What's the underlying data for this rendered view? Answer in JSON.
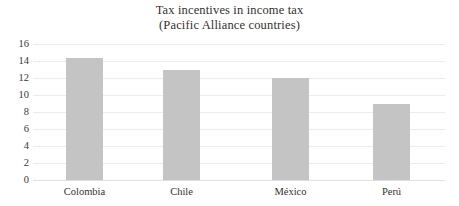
{
  "chart_data": {
    "type": "bar",
    "title": "Tax incentives in income tax",
    "subtitle": "(Pacific Alliance countries)",
    "xlabel": "",
    "ylabel": "",
    "categories": [
      "Colombia",
      "Chile",
      "México",
      "Perú"
    ],
    "values": [
      14.3,
      13.0,
      12.0,
      9.0
    ],
    "series": [
      {
        "name": "Tax incentives in income tax",
        "values": [
          14.3,
          13.0,
          12.0,
          9.0
        ]
      }
    ],
    "ylim": [
      0,
      16
    ],
    "ytick_labels": [
      "16",
      "14",
      "12",
      "10",
      "8",
      "6",
      "4",
      "2",
      "0"
    ],
    "ytick_values": [
      16,
      14,
      12,
      10,
      8,
      6,
      4,
      2,
      0
    ],
    "grid": true,
    "grid_axis": "y",
    "legend": false,
    "legend_position": "none",
    "bar_color": "#c4c4c4",
    "gridline_color": "#ececec",
    "background_color": "#ffffff",
    "text_color": "#33302f"
  }
}
